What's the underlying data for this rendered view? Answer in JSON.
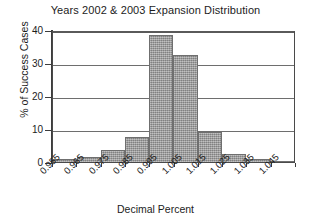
{
  "chart_data": {
    "type": "bar",
    "title": "Years 2002 & 2003 Expansion Distribution",
    "xlabel": "Decimal Percent",
    "ylabel": "% of Success Cases",
    "categories": [
      "0.955",
      "0.965",
      "0.975",
      "0.985",
      "0.995",
      "1.005",
      "1.015",
      "1.025",
      "1.035",
      "1.045"
    ],
    "values": [
      0.8,
      1.5,
      3.5,
      7.5,
      38.5,
      32.5,
      9.0,
      2.5,
      1.0,
      0.3
    ],
    "ylim": [
      0,
      40
    ],
    "yticks": [
      "0",
      "10",
      "20",
      "30",
      "40"
    ],
    "ytick_values": [
      0,
      10,
      20,
      30,
      40
    ],
    "grid": "horizontal",
    "legend": "none",
    "bar_color": "#9c9c9c",
    "bar_edge_color": "#6f6f6f",
    "axis_color": "#3d3d3d",
    "gridline_color": "#6e6e6e",
    "background_color": "#ffffff",
    "xtick_rotation": -45
  }
}
